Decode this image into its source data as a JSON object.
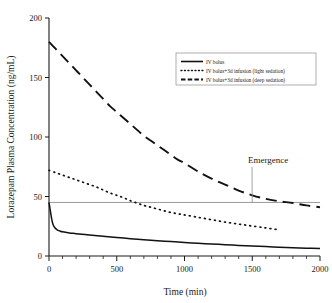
{
  "chart_data": {
    "type": "line",
    "title": "",
    "xlabel": "Time (min)",
    "ylabel": "Lorazepam Plasma Concentration (ng/mL)",
    "xlim": [
      0,
      2000
    ],
    "ylim": [
      0,
      200
    ],
    "xticks": [
      0,
      500,
      1000,
      1500,
      2000
    ],
    "yticks": [
      0,
      50,
      100,
      150,
      200
    ],
    "xtick_labels": [
      "0",
      "500",
      "1000",
      "1500",
      "2000"
    ],
    "ytick_labels": [
      "0",
      "50",
      "100",
      "150",
      "200"
    ],
    "grid": false,
    "legend_position": "upper right",
    "series": [
      {
        "name": "IV bolus",
        "style": "solid",
        "color": "#111111",
        "points": [
          [
            0,
            45
          ],
          [
            10,
            38
          ],
          [
            20,
            31
          ],
          [
            30,
            26.5
          ],
          [
            45,
            23.5
          ],
          [
            60,
            22.0
          ],
          [
            80,
            21.0
          ],
          [
            100,
            20.3
          ],
          [
            150,
            19.4
          ],
          [
            200,
            18.8
          ],
          [
            300,
            17.6
          ],
          [
            400,
            16.5
          ],
          [
            500,
            15.5
          ],
          [
            600,
            14.6
          ],
          [
            700,
            13.7
          ],
          [
            800,
            12.9
          ],
          [
            900,
            12.1
          ],
          [
            1000,
            11.4
          ],
          [
            1100,
            10.7
          ],
          [
            1200,
            10.1
          ],
          [
            1300,
            9.5
          ],
          [
            1400,
            8.9
          ],
          [
            1500,
            8.4
          ],
          [
            1600,
            7.9
          ],
          [
            1700,
            7.4
          ],
          [
            1800,
            7.0
          ],
          [
            1900,
            6.6
          ],
          [
            2000,
            6.2
          ]
        ]
      },
      {
        "name": "IV bolus+3d infusion (light sedation)",
        "style": "dotted",
        "color": "#111111",
        "points": [
          [
            0,
            72
          ],
          [
            50,
            70
          ],
          [
            100,
            68
          ],
          [
            150,
            66
          ],
          [
            200,
            64
          ],
          [
            250,
            62
          ],
          [
            300,
            60
          ],
          [
            350,
            58
          ],
          [
            400,
            55.5
          ],
          [
            450,
            53
          ],
          [
            500,
            51
          ],
          [
            550,
            49
          ],
          [
            600,
            46.5
          ],
          [
            650,
            44.5
          ],
          [
            700,
            42.5
          ],
          [
            750,
            41
          ],
          [
            800,
            39.5
          ],
          [
            850,
            38
          ],
          [
            900,
            36.5
          ],
          [
            950,
            35.5
          ],
          [
            1000,
            34.5
          ],
          [
            1100,
            32.5
          ],
          [
            1200,
            30.5
          ],
          [
            1300,
            28.5
          ],
          [
            1400,
            26.8
          ],
          [
            1500,
            25.2
          ],
          [
            1600,
            23.6
          ],
          [
            1680,
            22.3
          ]
        ]
      },
      {
        "name": "IV bolus+3d infusion (deep sedation)",
        "style": "dashed",
        "color": "#111111",
        "points": [
          [
            0,
            180
          ],
          [
            50,
            174
          ],
          [
            100,
            168
          ],
          [
            150,
            162
          ],
          [
            200,
            156
          ],
          [
            250,
            150
          ],
          [
            300,
            144
          ],
          [
            350,
            138
          ],
          [
            400,
            132
          ],
          [
            450,
            126
          ],
          [
            500,
            121
          ],
          [
            550,
            116
          ],
          [
            600,
            111
          ],
          [
            650,
            106
          ],
          [
            700,
            101
          ],
          [
            750,
            97
          ],
          [
            800,
            93
          ],
          [
            850,
            89
          ],
          [
            900,
            85
          ],
          [
            950,
            81
          ],
          [
            1000,
            78
          ],
          [
            1100,
            71
          ],
          [
            1200,
            65
          ],
          [
            1300,
            60
          ],
          [
            1400,
            55
          ],
          [
            1500,
            51
          ],
          [
            1600,
            48
          ],
          [
            1700,
            46
          ],
          [
            1800,
            44.5
          ],
          [
            1900,
            42.5
          ],
          [
            2000,
            41
          ]
        ]
      }
    ],
    "threshold_line": {
      "label": "Emergence",
      "value": 45,
      "orientation": "horizontal",
      "color": "#8d8d8d"
    },
    "annotations": [
      {
        "label": "Emergence",
        "x": 1500,
        "y": 45
      }
    ]
  },
  "legend": {
    "entries": [
      {
        "label": "IV bolus",
        "style": "solid"
      },
      {
        "label": "IV bolus+3d infusion (light sedation)",
        "style": "dotted"
      },
      {
        "label": "IV bolus+3d infusion (deep sedation)",
        "style": "dashed"
      }
    ]
  },
  "caption": {
    "text": ""
  }
}
